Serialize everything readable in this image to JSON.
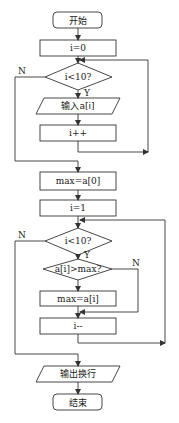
{
  "flowchart": {
    "start": "开始",
    "init_i0": "i=0",
    "cond1": "i<10?",
    "cond1_yes": "Y",
    "cond1_no": "N",
    "input": "输入a[i]",
    "inc": "i++",
    "init_max": "max=a[0]",
    "init_i1": "i=1",
    "cond2": "i<10?",
    "cond2_yes": "Y",
    "cond2_no": "N",
    "cond3": "a[i]>max?",
    "cond3_no": "N",
    "assign_max": "max=a[i]",
    "dec": "i--",
    "output": "输出换行",
    "end": "结束"
  },
  "colors": {
    "stroke": "#333333",
    "background": "#ffffff"
  }
}
